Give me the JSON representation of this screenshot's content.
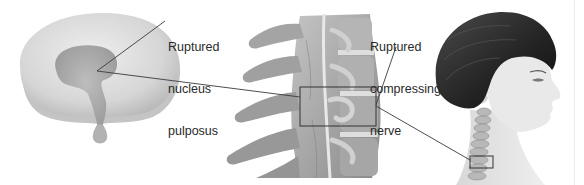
{
  "figure": {
    "panels": [
      {
        "id": "disc",
        "name": "Intervertebral disc (top view)"
      },
      {
        "id": "spine",
        "name": "Cervical spine segment (lateral view)"
      },
      {
        "id": "head",
        "name": "Head and neck profile with cervical spine"
      }
    ]
  },
  "labels": {
    "nucleus": {
      "lines": [
        "Ruptured",
        "nucleus",
        "pulposus"
      ]
    },
    "nerve": {
      "lines": [
        "Ruptured",
        "compressing",
        "nerve"
      ]
    }
  },
  "colors": {
    "background": "#ffffff",
    "disc_outer": "#d9d9d9",
    "disc_inner": "#a9a9a9",
    "bone": "#9c9c9c",
    "bone_dark": "#6f6f6f",
    "hair": "#2b2b2b",
    "skin": "#e6e6e6",
    "leader_line": "#3a3a3a"
  },
  "callouts": {
    "spine_box": {
      "x": 300,
      "y": 87,
      "w": 76,
      "h": 39
    },
    "neck_box": {
      "x": 470,
      "y": 156,
      "w": 23,
      "h": 12
    }
  }
}
